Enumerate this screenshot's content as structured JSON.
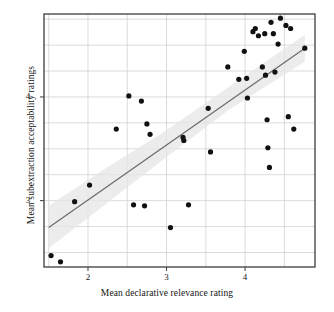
{
  "chart_data": {
    "type": "scatter",
    "title": "",
    "xlabel": "Mean declarative relevance rating",
    "ylabel": "Mean subextraction acceptability ratings",
    "xlim": [
      1.44,
      4.89
    ],
    "ylim": [
      2.36,
      4.8
    ],
    "xticks": [
      2,
      3,
      4
    ],
    "xtick_labels": [
      "2",
      "3",
      "4"
    ],
    "yticks": [
      3,
      4
    ],
    "ytick_labels": [
      "3",
      "4"
    ],
    "grid": true,
    "grid_color": "#cccccc",
    "grid_minor_step_x": 0.5,
    "grid_minor_step_y": 0.25,
    "legend": null,
    "point_color": "#111111",
    "point_size": 2.6,
    "trend_line": {
      "type": "linear-fit",
      "color": "#6b6b6b",
      "x_start": 1.5,
      "y_start": 2.74,
      "x_end": 4.76,
      "y_end": 4.47
    },
    "confidence_band": {
      "color": "#e6e6e6",
      "opacity": 0.75,
      "upper": [
        [
          1.5,
          2.95
        ],
        [
          2.2,
          3.3
        ],
        [
          3.0,
          3.68
        ],
        [
          3.8,
          4.1
        ],
        [
          4.76,
          4.6
        ]
      ],
      "lower": [
        [
          1.5,
          2.54
        ],
        [
          2.2,
          2.95
        ],
        [
          3.0,
          3.42
        ],
        [
          3.8,
          3.88
        ],
        [
          4.76,
          4.34
        ]
      ]
    },
    "points": [
      [
        1.53,
        2.47
      ],
      [
        1.65,
        2.41
      ],
      [
        1.83,
        2.99
      ],
      [
        2.02,
        3.15
      ],
      [
        2.36,
        3.69
      ],
      [
        2.52,
        4.01
      ],
      [
        2.58,
        2.96
      ],
      [
        2.68,
        3.96
      ],
      [
        2.72,
        2.95
      ],
      [
        2.75,
        3.74
      ],
      [
        2.79,
        3.64
      ],
      [
        3.05,
        2.74
      ],
      [
        3.21,
        3.61
      ],
      [
        3.22,
        3.58
      ],
      [
        3.28,
        2.96
      ],
      [
        3.53,
        3.89
      ],
      [
        3.56,
        3.47
      ],
      [
        3.78,
        4.29
      ],
      [
        3.92,
        4.17
      ],
      [
        3.99,
        4.44
      ],
      [
        4.02,
        4.18
      ],
      [
        4.03,
        3.99
      ],
      [
        4.1,
        4.63
      ],
      [
        4.13,
        4.66
      ],
      [
        4.17,
        4.59
      ],
      [
        4.22,
        4.29
      ],
      [
        4.25,
        4.61
      ],
      [
        4.26,
        4.21
      ],
      [
        4.28,
        3.78
      ],
      [
        4.29,
        3.51
      ],
      [
        4.31,
        3.32
      ],
      [
        4.33,
        4.72
      ],
      [
        4.36,
        4.61
      ],
      [
        4.38,
        4.24
      ],
      [
        4.42,
        4.51
      ],
      [
        4.45,
        4.76
      ],
      [
        4.52,
        4.69
      ],
      [
        4.55,
        3.81
      ],
      [
        4.58,
        4.66
      ],
      [
        4.62,
        3.69
      ],
      [
        4.76,
        4.47
      ]
    ]
  },
  "axis": {
    "frame_color": "#3d3d3d",
    "background": "#ffffff"
  }
}
